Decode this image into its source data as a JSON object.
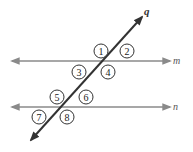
{
  "diagram": {
    "lines": {
      "m": "m",
      "n": "n",
      "q": "q"
    },
    "angles": [
      "1",
      "2",
      "3",
      "4",
      "5",
      "6",
      "7",
      "8"
    ],
    "colors": {
      "parallel_lines": "#8a8a8a",
      "transversal": "#333333"
    }
  }
}
